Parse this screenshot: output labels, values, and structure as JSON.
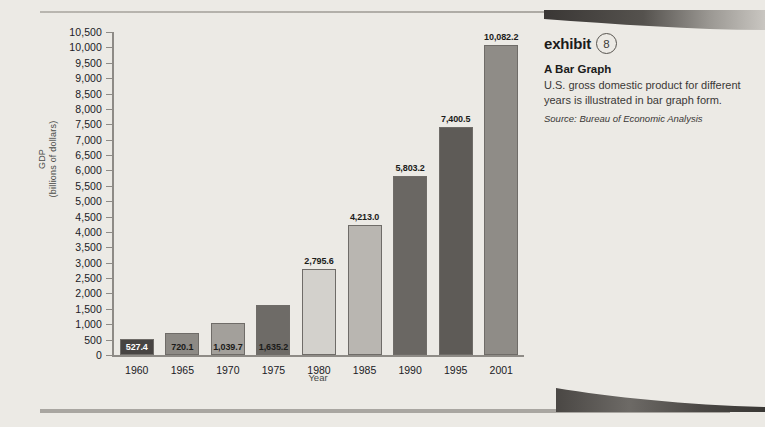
{
  "chart_data": {
    "type": "bar",
    "title": "",
    "xlabel": "Year",
    "ylabel_line1": "GDP",
    "ylabel_line2": "(billions of dollars)",
    "categories": [
      "1960",
      "1965",
      "1970",
      "1975",
      "1980",
      "1985",
      "1990",
      "1995",
      "2001"
    ],
    "values": [
      527.4,
      720.1,
      1039.7,
      1635.2,
      2795.6,
      4213.0,
      5803.2,
      7400.5,
      10082.2
    ],
    "value_labels": [
      "527.4",
      "720.1",
      "1,039.7",
      "1,635.2",
      "2,795.6",
      "4,213.0",
      "5,803.2",
      "7,400.5",
      "10,082.2"
    ],
    "bar_colors": [
      "#474442",
      "#8d8a85",
      "#a3a09b",
      "#6e6b67",
      "#d3d1cc",
      "#b9b6b1",
      "#6a6763",
      "#5e5b57",
      "#8f8c87"
    ],
    "label_colors": [
      "#ffffff",
      "#1b1b1a",
      "#1b1b1a",
      "#1b1b1a",
      "#1b1b1a",
      "#1b1b1a",
      "#1b1b1a",
      "#1b1b1a",
      "#1b1b1a"
    ],
    "label_inside": [
      true,
      true,
      true,
      true,
      false,
      false,
      false,
      false,
      false
    ],
    "ylim": [
      0,
      10500
    ],
    "ytick_step": 500,
    "ytick_labels": [
      "0",
      "500",
      "1,000",
      "1,500",
      "2,000",
      "2,500",
      "3,000",
      "3,500",
      "4,000",
      "4,500",
      "5,000",
      "5,500",
      "6,000",
      "6,500",
      "7,000",
      "7,500",
      "8,000",
      "8,500",
      "9,000",
      "9,500",
      "10,000",
      "10,500"
    ],
    "grid": false,
    "legend": false
  },
  "exhibit": {
    "word": "exhibit",
    "number": "8",
    "title": "A Bar Graph",
    "description": "U.S. gross domestic product for different years is illustrated in bar graph form.",
    "source": "Source: Bureau of Economic Analysis"
  },
  "colors": {
    "background": "#eceae5",
    "axis": "#8e8b86",
    "rule": "#a9a6a1",
    "text": "#20201f"
  }
}
